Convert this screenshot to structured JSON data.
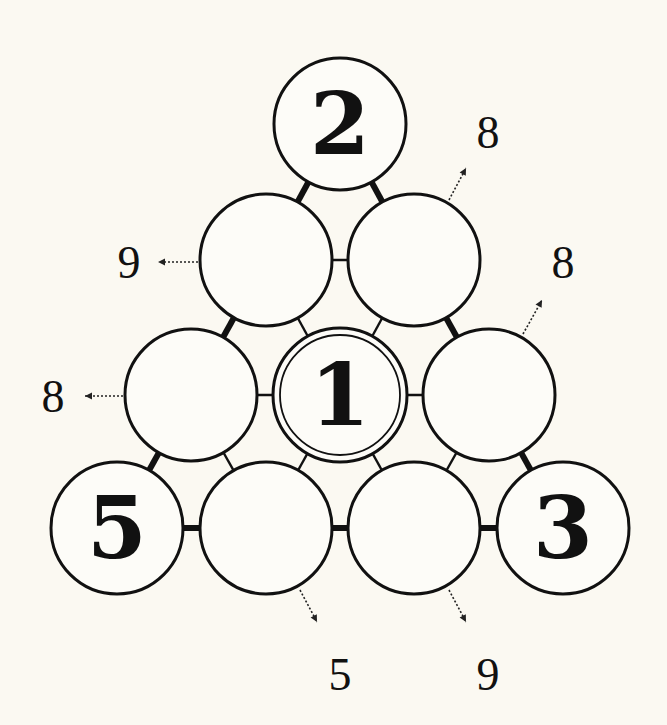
{
  "puzzle": {
    "type": "number-triangle",
    "background": "#fbf9f2",
    "line_color": "#111111",
    "circle_radius": 66,
    "nodes": [
      {
        "id": "top",
        "x": 340,
        "y": 124,
        "value": "2",
        "given": true
      },
      {
        "id": "r2-left",
        "x": 266,
        "y": 260,
        "value": "",
        "given": false
      },
      {
        "id": "r2-right",
        "x": 414,
        "y": 260,
        "value": "",
        "given": false
      },
      {
        "id": "r3-left",
        "x": 191,
        "y": 395,
        "value": "",
        "given": false
      },
      {
        "id": "center",
        "x": 340,
        "y": 395,
        "value": "1",
        "given": true,
        "double_ring": true
      },
      {
        "id": "r3-right",
        "x": 489,
        "y": 395,
        "value": "",
        "given": false
      },
      {
        "id": "bottom-left",
        "x": 117,
        "y": 528,
        "value": "5",
        "given": true
      },
      {
        "id": "b-2",
        "x": 266,
        "y": 528,
        "value": "",
        "given": false
      },
      {
        "id": "b-3",
        "x": 414,
        "y": 528,
        "value": "",
        "given": false
      },
      {
        "id": "bottom-right",
        "x": 563,
        "y": 528,
        "value": "3",
        "given": true
      }
    ],
    "connectors": [
      {
        "from": "top",
        "to": "r2-left",
        "weight": "thick"
      },
      {
        "from": "top",
        "to": "r2-right",
        "weight": "thick"
      },
      {
        "from": "r2-left",
        "to": "r2-right",
        "weight": "thin"
      },
      {
        "from": "r2-left",
        "to": "r3-left",
        "weight": "thick"
      },
      {
        "from": "r2-left",
        "to": "center",
        "weight": "thin"
      },
      {
        "from": "r2-right",
        "to": "center",
        "weight": "thin"
      },
      {
        "from": "r2-right",
        "to": "r3-right",
        "weight": "thick"
      },
      {
        "from": "r3-left",
        "to": "center",
        "weight": "thin"
      },
      {
        "from": "center",
        "to": "r3-right",
        "weight": "thin"
      },
      {
        "from": "r3-left",
        "to": "bottom-left",
        "weight": "thick"
      },
      {
        "from": "r3-left",
        "to": "b-2",
        "weight": "thin"
      },
      {
        "from": "center",
        "to": "b-2",
        "weight": "thin"
      },
      {
        "from": "center",
        "to": "b-3",
        "weight": "thin"
      },
      {
        "from": "r3-right",
        "to": "b-3",
        "weight": "thin"
      },
      {
        "from": "r3-right",
        "to": "bottom-right",
        "weight": "thick"
      },
      {
        "from": "bottom-left",
        "to": "b-2",
        "weight": "thick"
      },
      {
        "from": "b-2",
        "to": "b-3",
        "weight": "thick"
      },
      {
        "from": "b-3",
        "to": "bottom-right",
        "weight": "thick"
      }
    ],
    "clues": [
      {
        "id": "clue-r2-right",
        "label": "8",
        "tx": 488,
        "ty": 148,
        "ax1": 449,
        "ay1": 200,
        "ax2": 466,
        "ay2": 168
      },
      {
        "id": "clue-r2-left",
        "label": "9",
        "tx": 129,
        "ty": 278,
        "ax1": 198,
        "ay1": 262,
        "ax2": 158,
        "ay2": 262
      },
      {
        "id": "clue-r3-right",
        "label": "8",
        "tx": 563,
        "ty": 278,
        "ax1": 523,
        "ay1": 334,
        "ax2": 542,
        "ay2": 300
      },
      {
        "id": "clue-r3-left",
        "label": "8",
        "tx": 53,
        "ty": 412,
        "ax1": 123,
        "ay1": 396,
        "ax2": 85,
        "ay2": 396
      },
      {
        "id": "clue-b-2",
        "label": "5",
        "tx": 340,
        "ty": 690,
        "ax1": 300,
        "ay1": 590,
        "ax2": 317,
        "ay2": 622
      },
      {
        "id": "clue-b-3",
        "label": "9",
        "tx": 488,
        "ty": 690,
        "ax1": 449,
        "ay1": 590,
        "ax2": 466,
        "ay2": 622
      }
    ]
  }
}
